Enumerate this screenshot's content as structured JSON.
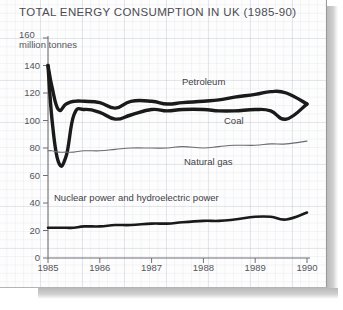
{
  "chart_data": {
    "type": "line",
    "title": "TOTAL ENERGY CONSUMPTION IN UK (1985-90)",
    "xlabel": "",
    "ylabel": "million tonnes",
    "ylim": [
      0,
      160
    ],
    "xlim": [
      1985,
      1990
    ],
    "yticks": [
      "0",
      "20",
      "40",
      "60",
      "80",
      "100",
      "120",
      "140",
      "160"
    ],
    "ytick_values": [
      0,
      20,
      40,
      60,
      80,
      100,
      120,
      140,
      160
    ],
    "xticks": [
      "1985",
      "1986",
      "1987",
      "1988",
      "1989",
      "1990"
    ],
    "xtick_values": [
      1985,
      1986,
      1987,
      1988,
      1989,
      1990
    ],
    "grid": true,
    "grid_style": "graph-paper",
    "legend_position": "inline-annotations",
    "x": [
      1985.0,
      1985.08,
      1985.2,
      1985.35,
      1985.5,
      1985.7,
      1986.0,
      1986.3,
      1986.6,
      1987.0,
      1987.3,
      1987.6,
      1988.0,
      1988.3,
      1988.6,
      1989.0,
      1989.3,
      1989.6,
      1990.0
    ],
    "series": [
      {
        "name": "Petroleum",
        "color": "#1a1a1a",
        "line_width": "thick",
        "label_x": 1988.0,
        "label_y": 128,
        "values": [
          140,
          124,
          108,
          112,
          114,
          114,
          113,
          109,
          114,
          114,
          112,
          113,
          114,
          115,
          117,
          119,
          121,
          120,
          112
        ]
      },
      {
        "name": "Coal",
        "color": "#1a1a1a",
        "line_width": "thick",
        "label_x": 1988.6,
        "label_y": 100,
        "values": [
          140,
          100,
          70,
          74,
          104,
          108,
          106,
          101,
          104,
          108,
          107,
          108,
          108,
          107,
          107,
          108,
          107,
          101,
          112
        ]
      },
      {
        "name": "Natural gas",
        "color": "#6a6a70",
        "line_width": "thin",
        "label_x": 1988.1,
        "label_y": 70,
        "values": [
          78,
          78,
          77,
          77,
          77,
          78,
          78,
          79,
          80,
          80,
          80,
          81,
          80,
          81,
          82,
          82,
          83,
          83,
          85
        ]
      },
      {
        "name": "Nuclear power and hydroelectric power",
        "color": "#1a1a1a",
        "line_width": "medium",
        "label_x": 1986.7,
        "label_y": 44,
        "values": [
          22,
          22,
          22,
          22,
          22,
          23,
          23,
          24,
          24,
          25,
          25,
          26,
          27,
          27,
          28,
          30,
          30,
          28,
          33
        ]
      }
    ]
  },
  "axis": {
    "unit_top_value": "160",
    "unit_caption": "million tonnes"
  }
}
